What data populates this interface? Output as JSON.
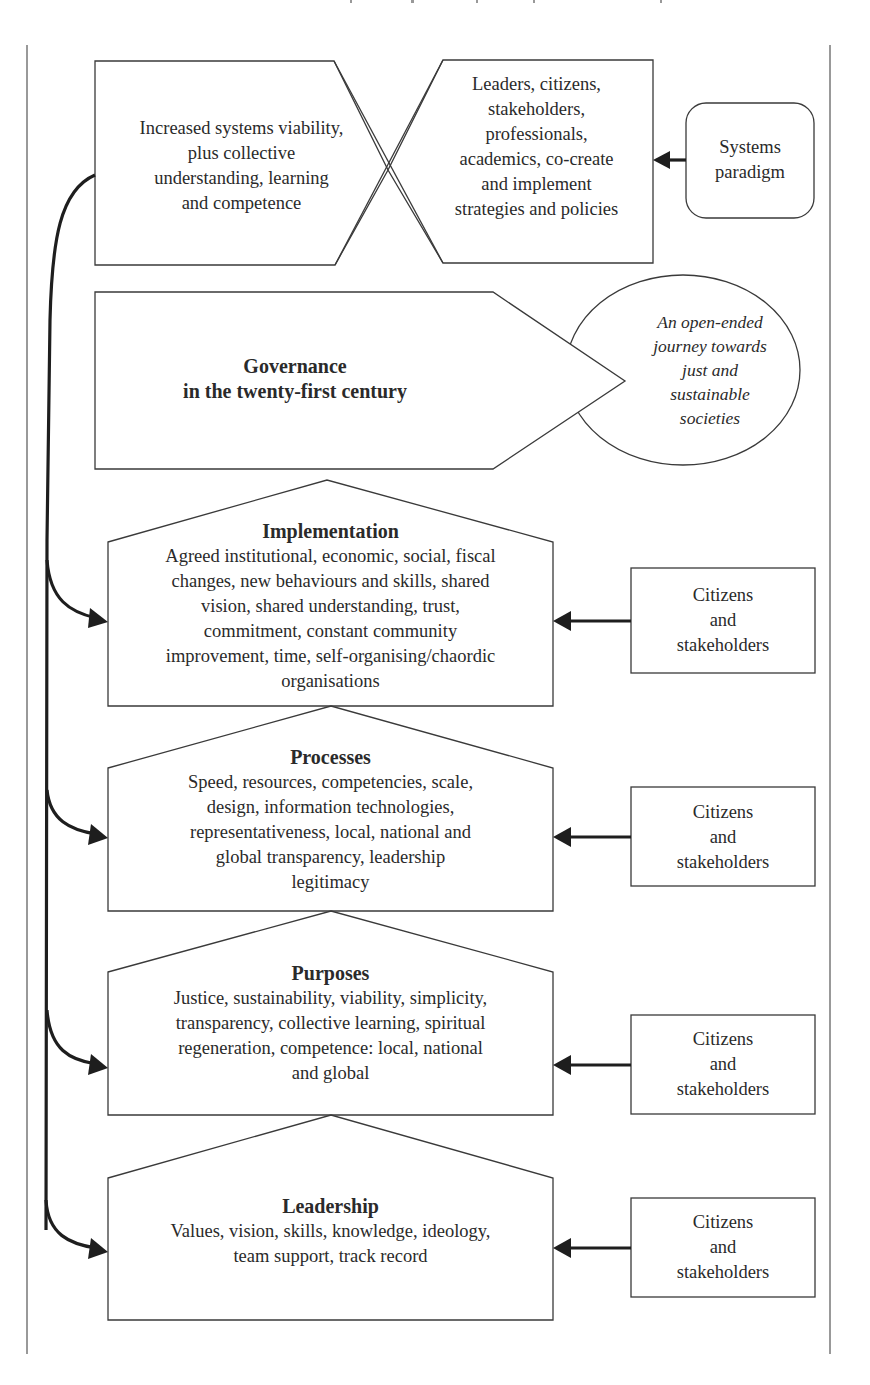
{
  "frame": {
    "stroke_color": "#555555"
  },
  "top": {
    "outcome_text": [
      "Increased systems viability,",
      "plus collective",
      "understanding, learning",
      "and competence"
    ],
    "actors_text": [
      "Leaders, citizens,",
      "stakeholders,",
      "professionals,",
      "academics, co-create",
      "and implement",
      "strategies and policies"
    ],
    "paradigm_text": [
      "Systems",
      "paradigm"
    ]
  },
  "governance": {
    "title_line1": "Governance",
    "title_line2": "in the twenty-first century",
    "journey_text": [
      "An open-ended",
      "journey towards",
      "just and",
      "sustainable",
      "societies"
    ]
  },
  "layers": [
    {
      "title": "Implementation",
      "lines": [
        "Agreed institutional, economic, social, fiscal",
        "changes, new behaviours and skills, shared",
        "vision, shared understanding, trust,",
        "commitment, constant community",
        "improvement, time, self-organising/chaordic",
        "organisations"
      ],
      "input": [
        "Citizens",
        "and",
        "stakeholders"
      ]
    },
    {
      "title": "Processes",
      "lines": [
        "Speed, resources, competencies, scale,",
        "design, information technologies,",
        "representativeness, local, national and",
        "global transparency, leadership",
        "legitimacy"
      ],
      "input": [
        "Citizens",
        "and",
        "stakeholders"
      ]
    },
    {
      "title": "Purposes",
      "lines": [
        "Justice, sustainability, viability, simplicity,",
        "transparency, collective learning, spiritual",
        "regeneration, competence: local, national",
        "and global"
      ],
      "input": [
        "Citizens",
        "and",
        "stakeholders"
      ]
    },
    {
      "title": "Leadership",
      "lines": [
        "Values, vision, skills, knowledge, ideology,",
        "team support, track record"
      ],
      "input": [
        "Citizens",
        "and",
        "stakeholders"
      ]
    }
  ]
}
